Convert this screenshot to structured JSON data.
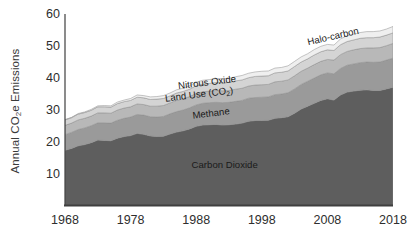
{
  "chart_data": {
    "type": "area",
    "title": "",
    "subtitle": "",
    "xlabel": "",
    "ylabel": "Annual CO2e Emissions",
    "ylabel_parts": {
      "pre": "Annual CO",
      "sub": "2",
      "post": "e Emissions"
    },
    "stacked": true,
    "grid": false,
    "legend_position": "inline-annotations",
    "xlim": [
      1968,
      2018
    ],
    "ylim": [
      0,
      60
    ],
    "xticks": [
      1968,
      1978,
      1988,
      1998,
      2008,
      2018
    ],
    "xtick_labels": [
      "1968",
      "1978",
      "1988",
      "1998",
      "2008",
      "2018"
    ],
    "yticks": [
      10,
      20,
      30,
      40,
      50,
      60
    ],
    "ytick_labels": [
      "10",
      "20",
      "30",
      "40",
      "50",
      "60"
    ],
    "x": [
      1968,
      1969,
      1970,
      1971,
      1972,
      1973,
      1974,
      1975,
      1976,
      1977,
      1978,
      1979,
      1980,
      1981,
      1982,
      1983,
      1984,
      1985,
      1986,
      1987,
      1988,
      1989,
      1990,
      1991,
      1992,
      1993,
      1994,
      1995,
      1996,
      1997,
      1998,
      1999,
      2000,
      2001,
      2002,
      2003,
      2004,
      2005,
      2006,
      2007,
      2008,
      2009,
      2010,
      2011,
      2012,
      2013,
      2014,
      2015,
      2016,
      2017,
      2018
    ],
    "series": [
      {
        "name": "Carbon Dioxide",
        "color": "#5e5e5e",
        "label": "Carbon Dioxide",
        "values": [
          17.4,
          18.0,
          18.8,
          19.2,
          19.8,
          20.6,
          20.5,
          20.4,
          21.2,
          21.7,
          22.0,
          22.7,
          22.4,
          21.9,
          21.7,
          21.8,
          22.5,
          23.1,
          23.5,
          24.1,
          24.9,
          25.3,
          25.4,
          25.5,
          25.3,
          25.4,
          25.6,
          25.9,
          26.5,
          26.7,
          26.7,
          26.8,
          27.4,
          27.6,
          27.9,
          29.0,
          30.3,
          31.2,
          32.1,
          33.0,
          33.5,
          33.1,
          34.7,
          35.6,
          35.9,
          36.2,
          36.3,
          36.1,
          36.1,
          36.6,
          37.1
        ]
      },
      {
        "name": "Methane",
        "color": "#9a9a9a",
        "label": "Methane",
        "values": [
          4.9,
          5.0,
          5.1,
          5.2,
          5.3,
          5.4,
          5.5,
          5.5,
          5.6,
          5.7,
          5.8,
          5.9,
          6.0,
          6.0,
          6.1,
          6.2,
          6.3,
          6.4,
          6.5,
          6.6,
          6.7,
          6.8,
          6.9,
          6.9,
          7.0,
          7.0,
          7.1,
          7.1,
          7.2,
          7.2,
          7.3,
          7.3,
          7.4,
          7.4,
          7.5,
          7.6,
          7.7,
          7.8,
          7.9,
          8.0,
          8.1,
          8.2,
          8.3,
          8.4,
          8.5,
          8.6,
          8.7,
          8.8,
          8.9,
          9.0,
          9.1
        ]
      },
      {
        "name": "Land Use (CO2)",
        "color": "#b8b8b8",
        "label": "Land Use (CO2)",
        "label_parts": {
          "pre": "Land Use (CO",
          "sub": "2",
          "post": ")"
        },
        "values": [
          2.9,
          2.9,
          3.0,
          3.0,
          3.0,
          3.1,
          3.1,
          3.1,
          3.2,
          3.2,
          3.2,
          3.3,
          3.3,
          3.3,
          3.4,
          3.4,
          3.4,
          3.5,
          3.5,
          3.5,
          3.6,
          3.6,
          3.6,
          3.7,
          3.7,
          3.7,
          3.8,
          3.8,
          3.8,
          3.9,
          3.9,
          3.9,
          4.0,
          4.0,
          4.0,
          4.1,
          4.1,
          4.1,
          4.2,
          4.2,
          4.2,
          4.3,
          4.3,
          4.3,
          4.4,
          4.4,
          4.4,
          4.5,
          4.5,
          4.5,
          4.6
        ]
      },
      {
        "name": "Nitrous Oxide",
        "color": "#d4d4d4",
        "label": "Nitrous Oxide",
        "values": [
          1.7,
          1.7,
          1.8,
          1.8,
          1.8,
          1.9,
          1.9,
          1.9,
          2.0,
          2.0,
          2.0,
          2.1,
          2.1,
          2.1,
          2.2,
          2.2,
          2.2,
          2.3,
          2.3,
          2.3,
          2.4,
          2.4,
          2.4,
          2.5,
          2.5,
          2.5,
          2.6,
          2.6,
          2.6,
          2.7,
          2.7,
          2.7,
          2.8,
          2.8,
          2.8,
          2.9,
          2.9,
          2.9,
          3.0,
          3.0,
          3.0,
          3.0,
          3.1,
          3.1,
          3.1,
          3.2,
          3.2,
          3.2,
          3.3,
          3.3,
          3.3
        ]
      },
      {
        "name": "Halo-carbon",
        "color": "#efefef",
        "label": "Halo-carbon",
        "values": [
          0.1,
          0.1,
          0.2,
          0.2,
          0.3,
          0.3,
          0.4,
          0.4,
          0.5,
          0.5,
          0.6,
          0.7,
          0.7,
          0.8,
          0.8,
          0.9,
          0.9,
          1.0,
          1.0,
          1.1,
          1.1,
          1.2,
          1.2,
          1.2,
          1.3,
          1.3,
          1.3,
          1.4,
          1.4,
          1.4,
          1.5,
          1.5,
          1.5,
          1.5,
          1.6,
          1.6,
          1.6,
          1.6,
          1.7,
          1.7,
          1.7,
          1.7,
          1.8,
          1.8,
          1.8,
          1.8,
          1.9,
          1.9,
          1.9,
          1.9,
          2.0
        ]
      }
    ],
    "totals_endpoints": {
      "first_year": 1968,
      "first_total": 27.0,
      "last_year": 2018,
      "last_total": 52.5
    },
    "annotations": [
      {
        "text": "Halo-carbon",
        "series": "Halo-carbon"
      },
      {
        "text": "Nitrous Oxide",
        "series": "Nitrous Oxide"
      },
      {
        "text": "Land Use (CO2)",
        "series": "Land Use (CO2)"
      },
      {
        "text": "Methane",
        "series": "Methane"
      },
      {
        "text": "Carbon Dioxide",
        "series": "Carbon Dioxide"
      }
    ],
    "axis_color": "#3f3f3f",
    "background": "#ffffff"
  }
}
